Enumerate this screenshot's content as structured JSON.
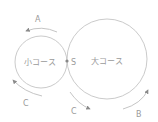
{
  "diagram": {
    "type": "two-course-track",
    "colors": {
      "line": "#c4c4c4",
      "arrow": "#8a8a8a",
      "text": "#9a9a9a",
      "point": "#888888"
    },
    "small_course": {
      "label": "小コース"
    },
    "large_course": {
      "label": "大コース"
    },
    "start_point": {
      "label": "S"
    },
    "arrows": [
      {
        "label": "A"
      },
      {
        "label": "C"
      },
      {
        "label": "C"
      },
      {
        "label": "B"
      }
    ]
  }
}
